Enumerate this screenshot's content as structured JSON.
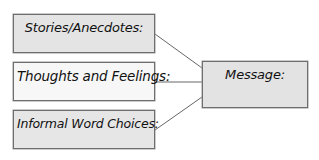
{
  "diagram": {
    "type": "concept-map",
    "inputs": [
      {
        "id": "stories",
        "label": "Stories/Anecdotes:"
      },
      {
        "id": "thoughts",
        "label": "Thoughts and Feelings:"
      },
      {
        "id": "informal",
        "label": "Informal Word Choices:"
      }
    ],
    "output": {
      "id": "message",
      "label": "Message:"
    },
    "edges": [
      {
        "from": "stories",
        "to": "message"
      },
      {
        "from": "thoughts",
        "to": "message"
      },
      {
        "from": "informal",
        "to": "message"
      }
    ],
    "colors": {
      "box_fill_gray": "#e4e4e4",
      "box_fill_light": "#f7f7f7",
      "border": "#6e6e6e",
      "connector": "#555555"
    }
  }
}
